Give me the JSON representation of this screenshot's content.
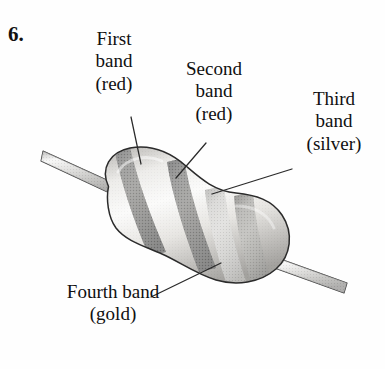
{
  "figure": {
    "question_number": "6.",
    "background_color": "#fefefe",
    "ink_color": "#101010"
  },
  "labels": [
    {
      "id": "first-band",
      "name": "label-first-band",
      "lines": [
        "First",
        "band",
        "(red)"
      ],
      "band_color_name": "red"
    },
    {
      "id": "second-band",
      "name": "label-second-band",
      "lines": [
        "Second",
        "band",
        "(red)"
      ],
      "band_color_name": "red"
    },
    {
      "id": "third-band",
      "name": "label-third-band",
      "lines": [
        "Third",
        "band",
        "(silver)"
      ],
      "band_color_name": "silver"
    },
    {
      "id": "fourth-band",
      "name": "label-fourth-band",
      "lines": [
        "Fourth band",
        "(gold)"
      ],
      "band_color_name": "gold"
    }
  ],
  "diagram": {
    "type": "resistor-illustration",
    "rendering": "grayscale halftone line art",
    "body_fill_light": "#f2f1ef",
    "body_fill_mid": "#d2d0cc",
    "body_fill_shadow": "#9d9b97",
    "outline_color": "#2b2b2b",
    "lead_fill_light": "#eeeeee",
    "lead_fill_mid": "#b4b3b0",
    "lead_fill_dark": "#7a7977",
    "leader_line_color": "#2a2a2a",
    "bands": [
      {
        "index": 1,
        "color_name": "red",
        "gray_fill": "#4a4a4a"
      },
      {
        "index": 2,
        "color_name": "red",
        "gray_fill": "#4a4a4a"
      },
      {
        "index": 3,
        "color_name": "silver",
        "gray_fill": "#a9a8a4"
      },
      {
        "index": 4,
        "color_name": "gold",
        "gray_fill": "#8e8d89"
      }
    ],
    "leads": [
      {
        "id": "lead-left",
        "from": [
          42,
          157
        ],
        "to": [
          112,
          189
        ]
      },
      {
        "id": "lead-right",
        "from": [
          276,
          262
        ],
        "to": [
          348,
          288
        ]
      }
    ],
    "leader_lines": [
      {
        "id": "leader-first",
        "from": [
          131,
          117
        ],
        "to": [
          141,
          164
        ]
      },
      {
        "id": "leader-second",
        "from": [
          206,
          143
        ],
        "to": [
          176,
          178
        ]
      },
      {
        "id": "leader-third",
        "from": [
          292,
          169
        ],
        "to": [
          212,
          194
        ]
      },
      {
        "id": "leader-fourth",
        "from": [
          151,
          297
        ],
        "to": [
          221,
          263
        ]
      }
    ]
  }
}
